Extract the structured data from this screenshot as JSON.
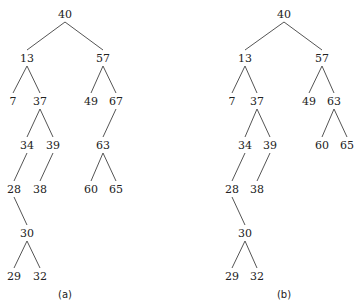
{
  "trees": [
    {
      "caption": "(a)",
      "caption_pos": [
        65,
        294
      ],
      "nodes": [
        {
          "id": "40",
          "label": "40",
          "x": 65,
          "y": 14
        },
        {
          "id": "13",
          "label": "13",
          "x": 27,
          "y": 58
        },
        {
          "id": "57",
          "label": "57",
          "x": 103,
          "y": 58
        },
        {
          "id": "7",
          "label": "7",
          "x": 13,
          "y": 101
        },
        {
          "id": "37",
          "label": "37",
          "x": 40,
          "y": 101
        },
        {
          "id": "49",
          "label": "49",
          "x": 91,
          "y": 101
        },
        {
          "id": "67",
          "label": "67",
          "x": 116,
          "y": 101
        },
        {
          "id": "34",
          "label": "34",
          "x": 27,
          "y": 145
        },
        {
          "id": "39",
          "label": "39",
          "x": 53,
          "y": 145
        },
        {
          "id": "63",
          "label": "63",
          "x": 103,
          "y": 145
        },
        {
          "id": "28",
          "label": "28",
          "x": 14,
          "y": 189
        },
        {
          "id": "38",
          "label": "38",
          "x": 40,
          "y": 189
        },
        {
          "id": "60",
          "label": "60",
          "x": 91,
          "y": 189
        },
        {
          "id": "65",
          "label": "65",
          "x": 116,
          "y": 189
        },
        {
          "id": "30",
          "label": "30",
          "x": 27,
          "y": 233
        },
        {
          "id": "29",
          "label": "29",
          "x": 14,
          "y": 276
        },
        {
          "id": "32",
          "label": "32",
          "x": 40,
          "y": 276
        }
      ],
      "edges": [
        [
          "40",
          "13"
        ],
        [
          "40",
          "57"
        ],
        [
          "13",
          "7"
        ],
        [
          "13",
          "37"
        ],
        [
          "57",
          "49"
        ],
        [
          "57",
          "67"
        ],
        [
          "37",
          "34"
        ],
        [
          "37",
          "39"
        ],
        [
          "67",
          "63"
        ],
        [
          "34",
          "28"
        ],
        [
          "39",
          "38"
        ],
        [
          "63",
          "60"
        ],
        [
          "63",
          "65"
        ],
        [
          "28",
          "30"
        ],
        [
          "30",
          "29"
        ],
        [
          "30",
          "32"
        ]
      ]
    },
    {
      "caption": "(b)",
      "caption_pos": [
        284,
        294
      ],
      "nodes": [
        {
          "id": "40",
          "label": "40",
          "x": 284,
          "y": 14
        },
        {
          "id": "13",
          "label": "13",
          "x": 245,
          "y": 58
        },
        {
          "id": "57",
          "label": "57",
          "x": 322,
          "y": 58
        },
        {
          "id": "7",
          "label": "7",
          "x": 232,
          "y": 101
        },
        {
          "id": "37",
          "label": "37",
          "x": 257,
          "y": 101
        },
        {
          "id": "49",
          "label": "49",
          "x": 309,
          "y": 101
        },
        {
          "id": "63",
          "label": "63",
          "x": 334,
          "y": 101
        },
        {
          "id": "34",
          "label": "34",
          "x": 245,
          "y": 145
        },
        {
          "id": "39",
          "label": "39",
          "x": 270,
          "y": 145
        },
        {
          "id": "60",
          "label": "60",
          "x": 322,
          "y": 145
        },
        {
          "id": "65",
          "label": "65",
          "x": 347,
          "y": 145
        },
        {
          "id": "28",
          "label": "28",
          "x": 232,
          "y": 189
        },
        {
          "id": "38",
          "label": "38",
          "x": 257,
          "y": 189
        },
        {
          "id": "30",
          "label": "30",
          "x": 245,
          "y": 233
        },
        {
          "id": "29",
          "label": "29",
          "x": 232,
          "y": 276
        },
        {
          "id": "32",
          "label": "32",
          "x": 257,
          "y": 276
        }
      ],
      "edges": [
        [
          "40",
          "13"
        ],
        [
          "40",
          "57"
        ],
        [
          "13",
          "7"
        ],
        [
          "13",
          "37"
        ],
        [
          "57",
          "49"
        ],
        [
          "57",
          "63"
        ],
        [
          "37",
          "34"
        ],
        [
          "37",
          "39"
        ],
        [
          "63",
          "60"
        ],
        [
          "63",
          "65"
        ],
        [
          "34",
          "28"
        ],
        [
          "39",
          "38"
        ],
        [
          "28",
          "30"
        ],
        [
          "30",
          "29"
        ],
        [
          "30",
          "32"
        ]
      ]
    }
  ],
  "style": {
    "line_color": "#555555",
    "text_color": "#222222"
  }
}
